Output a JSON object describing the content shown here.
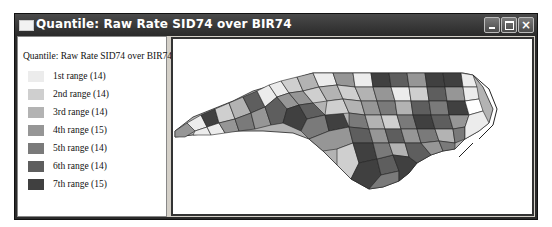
{
  "window": {
    "title": "Quantile: Raw Rate SID74 over BIR74",
    "controls": {
      "minimize": "minimize",
      "maximize": "maximize",
      "close": "×"
    }
  },
  "legend": {
    "title": "Quantile: Raw Rate SID74 over BIR74",
    "items": [
      {
        "label": "1st range (14)",
        "color": "#ececec"
      },
      {
        "label": "2nd range (14)",
        "color": "#cfcfcf"
      },
      {
        "label": "3rd range (14)",
        "color": "#b3b3b3"
      },
      {
        "label": "4th range (15)",
        "color": "#969696"
      },
      {
        "label": "5th range (14)",
        "color": "#7a7a7a"
      },
      {
        "label": "6th range (14)",
        "color": "#5e5e5e"
      },
      {
        "label": "7th range (15)",
        "color": "#404040"
      }
    ]
  },
  "map": {
    "subject": "North Carolina counties choropleth",
    "variable": "Raw Rate SID74 over BIR74",
    "classification": "Quantile",
    "classes": 7
  }
}
